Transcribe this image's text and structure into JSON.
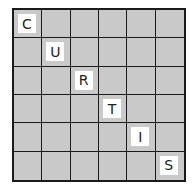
{
  "puzzle": {
    "rows": 6,
    "cols": 6,
    "word": "CURTIS",
    "letters": [
      {
        "row": 0,
        "col": 0,
        "char": "C"
      },
      {
        "row": 1,
        "col": 1,
        "char": "U"
      },
      {
        "row": 2,
        "col": 2,
        "char": "R"
      },
      {
        "row": 3,
        "col": 3,
        "char": "T"
      },
      {
        "row": 4,
        "col": 4,
        "char": "I"
      },
      {
        "row": 5,
        "col": 5,
        "char": "S"
      }
    ],
    "colors": {
      "cell": "#c9c9c9",
      "tile": "#ffffff",
      "line": "#1a1a1a"
    }
  }
}
